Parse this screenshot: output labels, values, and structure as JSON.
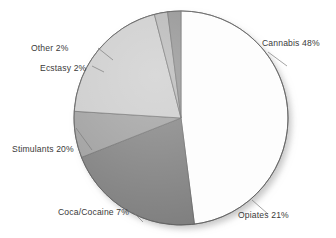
{
  "chart_data": {
    "type": "pie",
    "title": "",
    "subtitle": "",
    "xlabel": "",
    "ylabel": "",
    "legend_position": "none",
    "grid": false,
    "labels_inline": true,
    "start_angle_deg": 0,
    "direction": "clockwise",
    "categories": [
      "Cannabis",
      "Opiates",
      "Coca/Cocaine",
      "Stimulants",
      "Ecstasy",
      "Other"
    ],
    "values": [
      48,
      21,
      7,
      20,
      2,
      2
    ],
    "units": "percent",
    "slices": [
      {
        "name": "Cannabis",
        "value": 48,
        "label": "Cannabis 48%",
        "color": "#fdfdfd"
      },
      {
        "name": "Opiates",
        "value": 21,
        "label": "Opiates 21%",
        "color": "#7c7c7c"
      },
      {
        "name": "Coca/Cocaine",
        "value": 7,
        "label": "Coca/Cocaine 7%",
        "color": "#9b9b9b"
      },
      {
        "name": "Stimulants",
        "value": 20,
        "label": "Stimulants 20%",
        "color": "#c9c9c9"
      },
      {
        "name": "Ecstasy",
        "value": 2,
        "label": "Ecstasy 2%",
        "color": "#b2b2b2"
      },
      {
        "name": "Other",
        "value": 2,
        "label": "Other 2%",
        "color": "#8a8a8a"
      }
    ],
    "total": 100
  },
  "figure": {
    "background_color": "#ffffff",
    "outline_color": "#5e5e5e",
    "label_color": "#3a3a3a",
    "center_x": 181,
    "center_y": 118,
    "radius": 107
  }
}
